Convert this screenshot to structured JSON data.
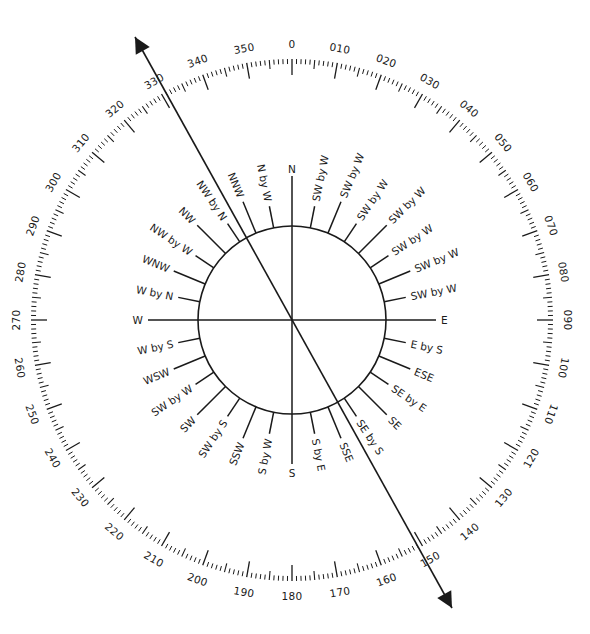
{
  "diagram": {
    "type": "compass-rose",
    "center": [
      292,
      320
    ],
    "colors": {
      "ink": "#1a1a1a",
      "background": "#ffffff"
    },
    "degree_ring": {
      "outer_radius": 261,
      "label_radius": 276,
      "tick_every_deg": 1,
      "medium_tick_every_deg": 5,
      "major_tick_every_deg": 10,
      "labels": [
        "0",
        "010",
        "020",
        "030",
        "040",
        "050",
        "060",
        "070",
        "080",
        "090",
        "100",
        "110",
        "120",
        "130",
        "140",
        "150",
        "160",
        "170",
        "180",
        "190",
        "200",
        "210",
        "220",
        "230",
        "240",
        "250",
        "260",
        "270",
        "280",
        "290",
        "300",
        "310",
        "320",
        "330",
        "340",
        "350"
      ]
    },
    "inner_circle": {
      "radius": 94
    },
    "compass_points": [
      {
        "deg": 0,
        "label": "N",
        "kind": "cardinal"
      },
      {
        "deg": 11.25,
        "label": "SW by W",
        "kind": "by"
      },
      {
        "deg": 22.5,
        "label": "SW by W",
        "kind": "three"
      },
      {
        "deg": 33.75,
        "label": "SW by W",
        "kind": "by"
      },
      {
        "deg": 45,
        "label": "SW by W",
        "kind": "inter"
      },
      {
        "deg": 56.25,
        "label": "SW by W",
        "kind": "by"
      },
      {
        "deg": 67.5,
        "label": "SW by W",
        "kind": "three"
      },
      {
        "deg": 78.75,
        "label": "SW by W",
        "kind": "by"
      },
      {
        "deg": 90,
        "label": "E",
        "kind": "cardinal"
      },
      {
        "deg": 101.25,
        "label": "E by S",
        "kind": "by"
      },
      {
        "deg": 112.5,
        "label": "ESE",
        "kind": "three"
      },
      {
        "deg": 123.75,
        "label": "SE by E",
        "kind": "by"
      },
      {
        "deg": 135,
        "label": "SE",
        "kind": "inter"
      },
      {
        "deg": 146.25,
        "label": "SE by S",
        "kind": "by"
      },
      {
        "deg": 157.5,
        "label": "SSE",
        "kind": "three"
      },
      {
        "deg": 168.75,
        "label": "S by E",
        "kind": "by"
      },
      {
        "deg": 180,
        "label": "S",
        "kind": "cardinal"
      },
      {
        "deg": 191.25,
        "label": "S by W",
        "kind": "by"
      },
      {
        "deg": 202.5,
        "label": "SSW",
        "kind": "three"
      },
      {
        "deg": 213.75,
        "label": "SW by S",
        "kind": "by"
      },
      {
        "deg": 225,
        "label": "SW",
        "kind": "inter"
      },
      {
        "deg": 236.25,
        "label": "SW by W",
        "kind": "by"
      },
      {
        "deg": 247.5,
        "label": "WSW",
        "kind": "three"
      },
      {
        "deg": 258.75,
        "label": "W by S",
        "kind": "by"
      },
      {
        "deg": 270,
        "label": "W",
        "kind": "cardinal"
      },
      {
        "deg": 281.25,
        "label": "W by N",
        "kind": "by"
      },
      {
        "deg": 292.5,
        "label": "WNW",
        "kind": "three"
      },
      {
        "deg": 303.75,
        "label": "NW by W",
        "kind": "by"
      },
      {
        "deg": 315,
        "label": "NW",
        "kind": "inter"
      },
      {
        "deg": 326.25,
        "label": "NW by N",
        "kind": "by"
      },
      {
        "deg": 337.5,
        "label": "NNW",
        "kind": "three"
      },
      {
        "deg": 348.75,
        "label": "N by W",
        "kind": "by"
      }
    ],
    "bearing_line": {
      "from": [
        135,
        37
      ],
      "to": [
        452,
        608
      ],
      "arrowheads": "both",
      "approx_bearing_deg": 150,
      "reciprocal_deg": 330
    }
  }
}
